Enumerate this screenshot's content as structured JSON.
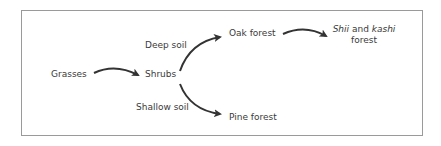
{
  "diagram": {
    "type": "succession-flow",
    "nodes": {
      "grasses": "Grasses",
      "shrubs": "Shrubs",
      "oak_forest": "Oak forest",
      "pine_forest": "Pine forest",
      "shii_kashi": {
        "line1_part1": "Shii",
        "line1_part2": " and ",
        "line1_part3": "kashi",
        "line2": "forest"
      }
    },
    "edge_labels": {
      "deep_soil": "Deep soil",
      "shallow_soil": "Shallow soil"
    },
    "edges": [
      {
        "from": "Grasses",
        "to": "Shrubs"
      },
      {
        "from": "Shrubs",
        "to": "Oak forest",
        "label": "Deep soil"
      },
      {
        "from": "Shrubs",
        "to": "Pine forest",
        "label": "Shallow soil"
      },
      {
        "from": "Oak forest",
        "to": "Shii and kashi forest"
      }
    ],
    "colors": {
      "border": "#9a9a9a",
      "arrow": "#333333",
      "text": "#3a3a3a"
    }
  }
}
